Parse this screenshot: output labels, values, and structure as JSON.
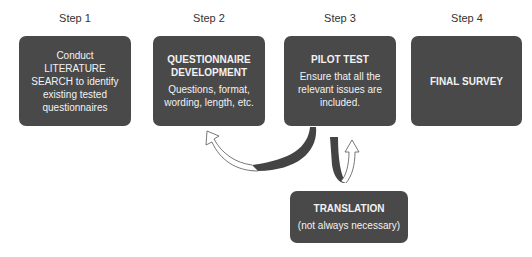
{
  "steps": [
    {
      "label": "Step 1",
      "box": {
        "text": "Conduct LITERATURE SEARCH to identify existing tested questionnaires"
      }
    },
    {
      "label": "Step 2",
      "box": {
        "title": "QUESTIONNAIRE DEVELOPMENT",
        "body": "Questions, format, wording, length, etc."
      }
    },
    {
      "label": "Step 3",
      "box": {
        "title": "PILOT TEST",
        "body": "Ensure that all the relevant issues are included."
      }
    },
    {
      "label": "Step 4",
      "box": {
        "title": "FINAL SURVEY"
      }
    }
  ],
  "translation": {
    "title": "TRANSLATION",
    "body": "(not always necessary)"
  },
  "colors": {
    "box": "#494949",
    "box_text": "#f2f2f2",
    "arrow_dark": "#444444",
    "background": "#ffffff"
  }
}
